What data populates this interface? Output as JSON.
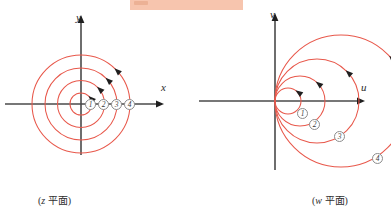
{
  "figure": {
    "title_band": {
      "name": "highlight-band",
      "color": "#f7c5ae",
      "x": 130,
      "y": 0,
      "width": 113,
      "height": 10
    },
    "curve_color": "#e8584b",
    "axis_color": "#4a4a4a",
    "label_ring_color": "#8c8c8c"
  },
  "panels": [
    {
      "id": "z-plane",
      "caption": "(z 平面)",
      "caption_var": "z",
      "caption_rest": " 平面)",
      "origin": {
        "x": 81,
        "y": 104
      },
      "axes": {
        "horizontal": {
          "label": "x",
          "label_x": 161,
          "label_y": 82,
          "x1": 5,
          "x2": 157,
          "y": 104
        },
        "vertical": {
          "label": "y",
          "label_x": 76,
          "label_y": 12,
          "y1": 155,
          "y2": 22,
          "x": 81
        }
      },
      "circles": [
        {
          "label": "1",
          "radius": 11,
          "label_x": 85,
          "label_y": 99
        },
        {
          "label": "2",
          "radius": 23.5,
          "label_x": 98,
          "label_y": 99
        },
        {
          "label": "3",
          "radius": 36,
          "label_x": 111,
          "label_y": 99
        },
        {
          "label": "4",
          "radius": 49,
          "label_x": 124,
          "label_y": 99
        }
      ],
      "direction": "counterclockwise",
      "arrow_angle_deg": 47
    },
    {
      "id": "w-plane",
      "caption": "(w 平面)",
      "caption_var": "w",
      "caption_rest": " 平面)",
      "origin": {
        "x": 275,
        "y": 101
      },
      "axes": {
        "horizontal": {
          "label": "u",
          "label_x": 361,
          "label_y": 82,
          "x1": 199,
          "x2": 358,
          "y": 101
        },
        "vertical": {
          "label": "v",
          "label_x": 270,
          "label_y": 9,
          "y1": 170,
          "y2": 20,
          "x": 275
        }
      },
      "circles": [
        {
          "label": "1",
          "radius": 13,
          "center_x": 288,
          "label_x": 297,
          "label_y": 108
        },
        {
          "label": "2",
          "radius": 25,
          "center_x": 300,
          "label_x": 309,
          "label_y": 119
        },
        {
          "label": "3",
          "radius": 42,
          "center_x": 317,
          "label_x": 334,
          "label_y": 131
        },
        {
          "label": "4",
          "radius": 66,
          "center_x": 341,
          "label_x": 372,
          "label_y": 153
        }
      ],
      "direction": "counterclockwise",
      "tangent_point": "origin",
      "tangent_axis": "v"
    }
  ]
}
